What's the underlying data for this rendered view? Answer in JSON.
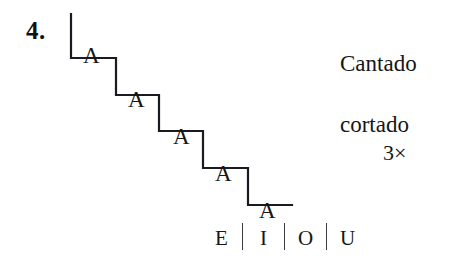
{
  "exercise": {
    "number": "4.",
    "type": "vocal-warmup-staircase"
  },
  "staircase": {
    "stroke_color": "#1a1a22",
    "stroke_width": 2.2,
    "steps": [
      {
        "label": "A",
        "x": 83,
        "y": 44
      },
      {
        "label": "A",
        "x": 128,
        "y": 88
      },
      {
        "label": "A",
        "x": 173,
        "y": 125
      },
      {
        "label": "A",
        "x": 215,
        "y": 162
      },
      {
        "label": "A",
        "x": 259,
        "y": 199
      }
    ],
    "path": "M 71,14 L 71,58 L 116,58 L 116,95 L 159,95 L 159,131 L 203,131 L 203,168 L 248,168 L 248,205 L 292,205"
  },
  "annotations": {
    "lyric_lines": [
      "Cantado",
      "cortado"
    ],
    "repeat": "3×"
  },
  "vowels": {
    "items": [
      "E",
      "I",
      "O",
      "U"
    ],
    "separator": "|"
  }
}
